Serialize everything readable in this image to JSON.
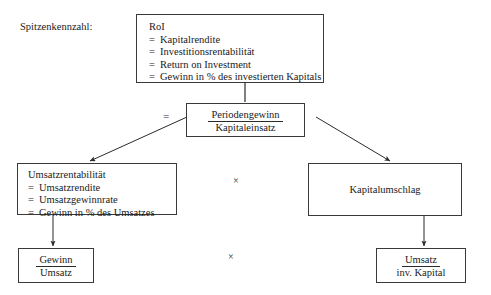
{
  "diagram": {
    "title_label": "Spitzenkennzahl:",
    "nodes": {
      "roi": {
        "heading": "RoI",
        "lines": [
          "Kapitalrendite",
          "Investitionsrentabilität",
          "Return on Investment",
          "Gewinn in % des investierten Kapitals"
        ],
        "eq_prefix": "="
      },
      "periodengewinn": {
        "numerator": "Periodengewinn",
        "denominator": "Kapitaleinsatz"
      },
      "umsatzrentabilitaet": {
        "heading": "Umsatzrentabilität",
        "lines": [
          "Umsatzrendite",
          "Umsatzgewinnrate",
          "Gewinn in % des Umsatzes"
        ],
        "eq_prefix": "="
      },
      "kapitalumschlag": {
        "label": "Kapitalumschlag"
      },
      "gewinn_umsatz": {
        "numerator": "Gewinn",
        "denominator": "Umsatz"
      },
      "umsatz_invkapital": {
        "numerator": "Umsatz",
        "denominator": "inv. Kapital"
      }
    },
    "operators": {
      "equals": "=",
      "times_upper": "×",
      "times_lower": "×"
    },
    "colors": {
      "background": "#ffffff",
      "border": "#3a3a3a",
      "text": "#1a1a1a",
      "connector": "#2a2a2a"
    }
  }
}
